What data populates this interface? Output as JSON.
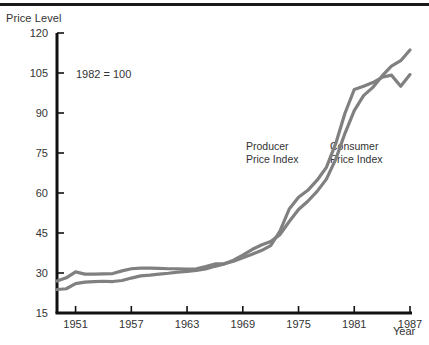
{
  "chart_data": {
    "type": "line",
    "title": "",
    "ylabel": "Price Level",
    "xlabel": "Year",
    "note": "1982 = 100",
    "ylim": [
      15,
      120
    ],
    "xlim": [
      1949,
      1987
    ],
    "grid": false,
    "legend_position": "inline-annotation",
    "y_ticks": [
      15,
      30,
      45,
      60,
      75,
      90,
      105,
      120
    ],
    "y_tick_labels": [
      "15",
      "30",
      "45",
      "60",
      "75",
      "90",
      "105",
      "120"
    ],
    "x_ticks": [
      1951,
      1957,
      1963,
      1969,
      1975,
      1981,
      1987
    ],
    "x_tick_labels": [
      "1951",
      "1957",
      "1963",
      "1969",
      "1975",
      "1981",
      "1987"
    ],
    "series": [
      {
        "name": "Producer Price Index",
        "color": "#808080",
        "label_line1": "Producer",
        "label_line2": "Price Index",
        "x": [
          1949,
          1950,
          1951,
          1952,
          1953,
          1954,
          1955,
          1956,
          1957,
          1958,
          1959,
          1960,
          1961,
          1962,
          1963,
          1964,
          1965,
          1966,
          1967,
          1968,
          1969,
          1970,
          1971,
          1972,
          1973,
          1974,
          1975,
          1976,
          1977,
          1978,
          1979,
          1980,
          1981,
          1982,
          1983,
          1984,
          1985,
          1986,
          1987
        ],
        "values": [
          27.0,
          28.2,
          30.4,
          29.6,
          29.6,
          29.7,
          29.8,
          30.8,
          31.6,
          31.8,
          31.8,
          31.7,
          31.6,
          31.6,
          31.5,
          31.6,
          32.4,
          33.4,
          33.5,
          34.4,
          35.7,
          37.0,
          38.4,
          40.3,
          45.7,
          54.0,
          58.4,
          61.0,
          64.8,
          69.6,
          78.5,
          89.9,
          98.8,
          100.0,
          101.4,
          103.4,
          104.2,
          100.0,
          104.4
        ]
      },
      {
        "name": "Consumer Price Index",
        "color": "#808080",
        "label_line1": "Consumer",
        "label_line2": "Price Index",
        "x": [
          1949,
          1950,
          1951,
          1952,
          1953,
          1954,
          1955,
          1956,
          1957,
          1958,
          1959,
          1960,
          1961,
          1962,
          1963,
          1964,
          1965,
          1966,
          1967,
          1968,
          1969,
          1970,
          1971,
          1972,
          1973,
          1974,
          1975,
          1976,
          1977,
          1978,
          1979,
          1980,
          1981,
          1982,
          1983,
          1984,
          1985,
          1986,
          1987
        ],
        "values": [
          23.8,
          24.1,
          26.0,
          26.6,
          26.8,
          26.9,
          26.8,
          27.2,
          28.1,
          28.9,
          29.2,
          29.6,
          29.9,
          30.3,
          30.6,
          31.0,
          31.5,
          32.5,
          33.4,
          34.8,
          36.7,
          38.8,
          40.5,
          41.8,
          44.4,
          49.3,
          53.8,
          56.9,
          60.6,
          65.2,
          72.6,
          82.4,
          90.9,
          96.5,
          99.6,
          103.9,
          107.6,
          109.6,
          113.6
        ]
      }
    ]
  },
  "axes": {
    "y_title": "Price Level",
    "x_title": "Year"
  }
}
